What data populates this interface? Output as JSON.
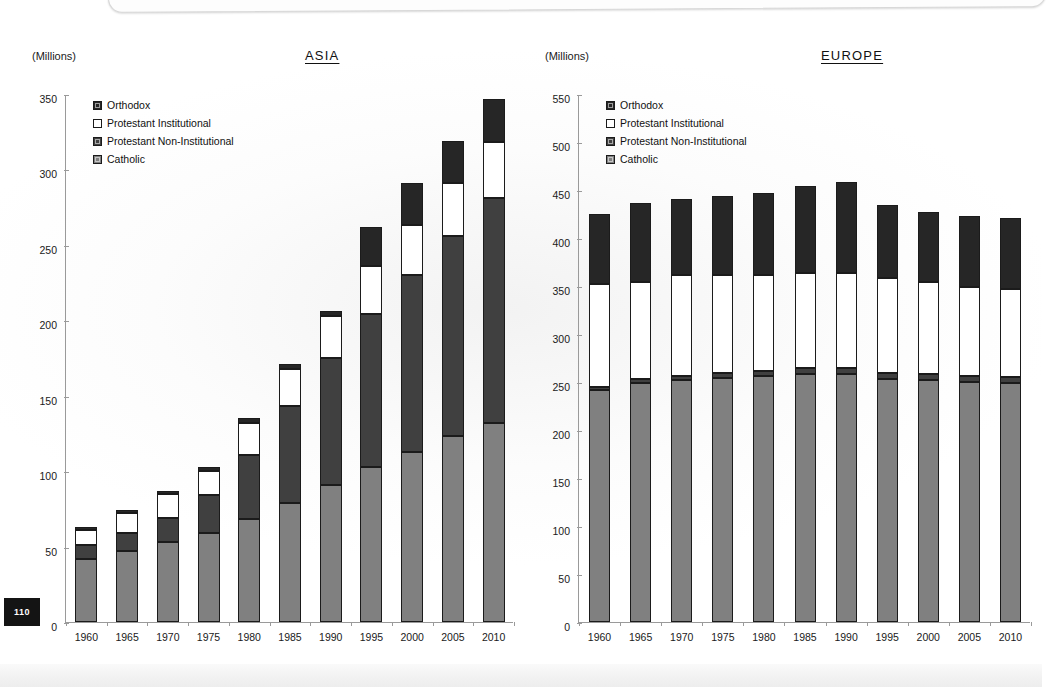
{
  "page": {
    "number": "110"
  },
  "units_label": "(Millions)",
  "legend_items": [
    {
      "key": "orthodox",
      "label": "Orthodox",
      "color": "#262626"
    },
    {
      "key": "protestant_institutional",
      "label": "Protestant Institutional",
      "color": "#ffffff"
    },
    {
      "key": "protestant_non_institutional",
      "label": "Protestant Non-Institutional",
      "color": "#404040"
    },
    {
      "key": "catholic",
      "label": "Catholic",
      "color": "#808080"
    }
  ],
  "charts": [
    {
      "id": "asia",
      "title": "ASIA",
      "units": "(Millions)",
      "yticks": [
        "0",
        "50",
        "100",
        "150",
        "200",
        "250",
        "300",
        "350"
      ],
      "xticks": [
        "1960",
        "1965",
        "1970",
        "1975",
        "1980",
        "1985",
        "1990",
        "1995",
        "2000",
        "2005",
        "2010"
      ]
    },
    {
      "id": "europe",
      "title": "EUROPE",
      "units": "(Millions)",
      "yticks": [
        "0",
        "50",
        "100",
        "150",
        "200",
        "250",
        "300",
        "350",
        "400",
        "450",
        "500",
        "550"
      ],
      "xticks": [
        "1960",
        "1965",
        "1970",
        "1975",
        "1980",
        "1985",
        "1990",
        "1995",
        "2000",
        "2005",
        "2010"
      ]
    }
  ],
  "chart_data": [
    {
      "id": "asia",
      "type": "bar",
      "stacked": true,
      "title": "ASIA",
      "xlabel": "",
      "ylabel": "(Millions)",
      "ylim": [
        0,
        350
      ],
      "ytick_step": 50,
      "grid": false,
      "legend_position": "inside-top-left",
      "categories": [
        "1960",
        "1965",
        "1970",
        "1975",
        "1980",
        "1985",
        "1990",
        "1995",
        "2000",
        "2005",
        "2010"
      ],
      "series": [
        {
          "name": "Catholic",
          "color": "#808080",
          "values": [
            42,
            47,
            53,
            59,
            68,
            79,
            91,
            103,
            113,
            123,
            132
          ]
        },
        {
          "name": "Protestant Non-Institutional",
          "color": "#404040",
          "values": [
            9,
            12,
            16,
            25,
            43,
            64,
            84,
            101,
            117,
            133,
            149
          ]
        },
        {
          "name": "Protestant Institutional",
          "color": "#ffffff",
          "values": [
            10,
            13,
            16,
            16,
            21,
            25,
            28,
            32,
            33,
            35,
            37
          ]
        },
        {
          "name": "Orthodox",
          "color": "#262626",
          "values": [
            2,
            2,
            2,
            3,
            3,
            3,
            3,
            26,
            28,
            28,
            29
          ]
        }
      ],
      "totals": [
        63,
        74,
        87,
        103,
        135,
        171,
        206,
        262,
        291,
        319,
        347
      ]
    },
    {
      "id": "europe",
      "type": "bar",
      "stacked": true,
      "title": "EUROPE",
      "xlabel": "",
      "ylabel": "(Millions)",
      "ylim": [
        0,
        550
      ],
      "ytick_step": 50,
      "grid": false,
      "legend_position": "inside-top-left",
      "categories": [
        "1960",
        "1965",
        "1970",
        "1975",
        "1980",
        "1985",
        "1990",
        "1995",
        "2000",
        "2005",
        "2010"
      ],
      "series": [
        {
          "name": "Catholic",
          "color": "#808080",
          "values": [
            242,
            249,
            252,
            254,
            256,
            258,
            258,
            253,
            252,
            250,
            249
          ]
        },
        {
          "name": "Protestant Non-Institutional",
          "color": "#404040",
          "values": [
            3,
            4,
            4,
            5,
            6,
            7,
            7,
            6,
            6,
            6,
            6
          ]
        },
        {
          "name": "Protestant Institutional",
          "color": "#ffffff",
          "values": [
            107,
            101,
            105,
            103,
            100,
            99,
            99,
            99,
            96,
            93,
            92
          ]
        },
        {
          "name": "Orthodox",
          "color": "#262626",
          "values": [
            73,
            82,
            80,
            82,
            85,
            90,
            94,
            76,
            73,
            74,
            74
          ]
        }
      ],
      "totals": [
        425,
        436,
        441,
        444,
        447,
        454,
        458,
        434,
        427,
        423,
        421
      ]
    }
  ]
}
